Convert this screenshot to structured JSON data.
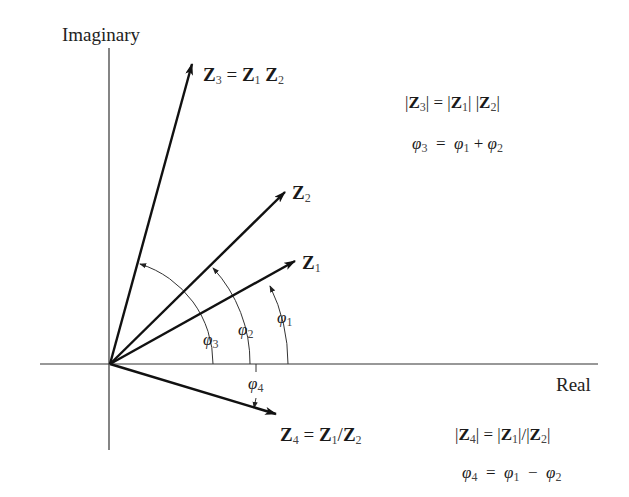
{
  "axes": {
    "imaginary_label": "Imaginary",
    "real_label": "Real",
    "origin": [
      110,
      364
    ]
  },
  "vectors": [
    {
      "name": "Z1",
      "label": "Z",
      "sub": "1",
      "tip": [
        295,
        261
      ]
    },
    {
      "name": "Z2",
      "label": "Z",
      "sub": "2",
      "tip": [
        285,
        192
      ]
    },
    {
      "name": "Z3",
      "label": "Z",
      "sub": "3",
      "tip": [
        192,
        64
      ],
      "caption": "Z₃ = Z₁ Z₂"
    },
    {
      "name": "Z4",
      "label": "Z",
      "sub": "4",
      "tip": [
        276,
        414
      ],
      "caption": "Z₄ = Z₁/Z₂"
    }
  ],
  "angles": [
    {
      "name": "phi1",
      "label": "φ",
      "sub": "1"
    },
    {
      "name": "phi2",
      "label": "φ",
      "sub": "2"
    },
    {
      "name": "phi3",
      "label": "φ",
      "sub": "3"
    },
    {
      "name": "phi4",
      "label": "φ",
      "sub": "4"
    }
  ],
  "equations": {
    "product_magnitude": "|Z₃| = |Z₁| |Z₂|",
    "product_angle": "φ₃ = φ₁ + φ₂",
    "quotient_magnitude": "|Z₄| = |Z₁|/|Z₂|",
    "quotient_angle": "φ₄ = φ₁ − φ₂"
  },
  "text": {
    "Z": "Z",
    "phi": "φ",
    "eq": "=",
    "plus": "+",
    "minus": "−",
    "slash": "/",
    "bar": "|",
    "s1": "1",
    "s2": "2",
    "s3": "3",
    "s4": "4"
  }
}
